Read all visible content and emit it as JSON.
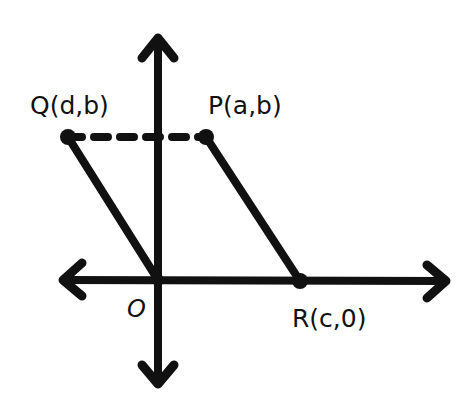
{
  "diagram": {
    "type": "coordinate-plane-parallelogram",
    "stroke_color": "#111111",
    "background": "#ffffff",
    "axes": {
      "origin_label": "O",
      "x_axis": "horizontal, double-headed arrow",
      "y_axis": "vertical, double-headed arrow"
    },
    "points": [
      {
        "id": "Q",
        "label": "Q(d,b)"
      },
      {
        "id": "P",
        "label": "P(a,b)"
      },
      {
        "id": "R",
        "label": "R(c,0)"
      },
      {
        "id": "O",
        "label": "O"
      }
    ],
    "segments": [
      {
        "from": "Q",
        "to": "P",
        "style": "dashed"
      },
      {
        "from": "Q",
        "to": "O",
        "style": "solid"
      },
      {
        "from": "P",
        "to": "R",
        "style": "solid"
      }
    ]
  }
}
